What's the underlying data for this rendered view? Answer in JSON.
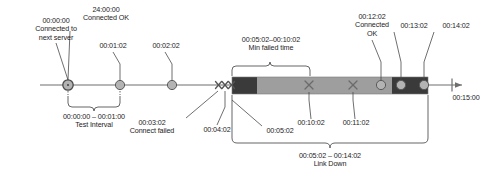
{
  "diagram": {
    "type": "timeline",
    "colors": {
      "axis": "#6e6e6e",
      "marker_fill": "#b3b3b3",
      "marker_stroke": "#5a5a5a",
      "bar_dark": "#3a3a3a",
      "bar_light": "#9e9e9e",
      "leader": "#4a4a4a",
      "text": "#1d1d1d"
    },
    "axis": {
      "start_x": 40,
      "end_x": 470,
      "y": 85,
      "end_tick_label": "00:15:00"
    },
    "annotations": {
      "start_event": {
        "time": "00:00:00",
        "line1": "Connected to",
        "line2": "next server"
      },
      "retry_event": {
        "time": "24:00:00",
        "status": "Connected OK"
      },
      "tick_1": "00:01:02",
      "tick_2": "00:02:02",
      "connect_failed_time": "00:03:02",
      "connect_failed_text": "Connect failed",
      "x_marker_2": "00:04:02",
      "x_marker_3": "00:05:02",
      "x_marker_4": "00:10:02",
      "x_marker_5": "00:11:02",
      "connected_ok_2_time": "00:12:02",
      "connected_ok_2_line1": "Connected",
      "connected_ok_2_line2": "OK",
      "dot_13": "00:13:02",
      "dot_14": "00:14:02",
      "end_tick": "00:15:00"
    },
    "braces": {
      "test_interval": {
        "range": "00:00:00 – 00:01:00",
        "label": "Test Interval"
      },
      "min_failed_time": {
        "range": "00:05:02–00:10:02",
        "label": "Min failed time"
      },
      "link_down": {
        "range": "00:05:02 – 00:14:02",
        "label": "Link Down"
      }
    },
    "markers": {
      "circles": [
        {
          "name": "circle-00-00-00",
          "x": 68
        },
        {
          "name": "circle-00-01-02",
          "x": 120
        },
        {
          "name": "circle-00-02-02",
          "x": 172
        },
        {
          "name": "circle-00-12-02",
          "x": 381
        },
        {
          "name": "circle-00-13-02",
          "x": 401
        },
        {
          "name": "circle-00-14-02",
          "x": 424
        }
      ],
      "x_marks": [
        {
          "name": "x-00-03-02",
          "x": 219
        },
        {
          "name": "x-00-04-02",
          "x": 225
        },
        {
          "name": "x-00-05-02",
          "x": 231
        },
        {
          "name": "x-00-10-02",
          "x": 309
        },
        {
          "name": "x-00-11-02",
          "x": 353
        }
      ]
    },
    "bar": {
      "left": 232,
      "right": 428,
      "top": 77,
      "height": 17,
      "dark_head_end": 257,
      "dark_tail_start": 392
    }
  }
}
